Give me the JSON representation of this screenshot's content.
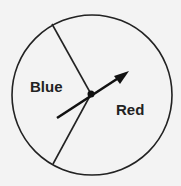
{
  "diagram": {
    "type": "spinner",
    "circle": {
      "cx": 92,
      "cy": 95,
      "r": 80
    },
    "center_point": {
      "x": 91,
      "y": 94
    },
    "dividers": [
      {
        "from": {
          "x": 91,
          "y": 94
        },
        "to": {
          "x": 52,
          "y": 24
        }
      },
      {
        "from": {
          "x": 91,
          "y": 94
        },
        "to": {
          "x": 53,
          "y": 164
        }
      }
    ],
    "arrow": {
      "tail": {
        "x": 57,
        "y": 118
      },
      "tip": {
        "x": 128,
        "y": 72
      }
    },
    "regions": [
      {
        "label": "Blue",
        "x": 30,
        "y": 92
      },
      {
        "label": "Red",
        "x": 116,
        "y": 115
      }
    ],
    "colors": {
      "stroke": "#222222",
      "background": "#f3f3f3"
    }
  }
}
